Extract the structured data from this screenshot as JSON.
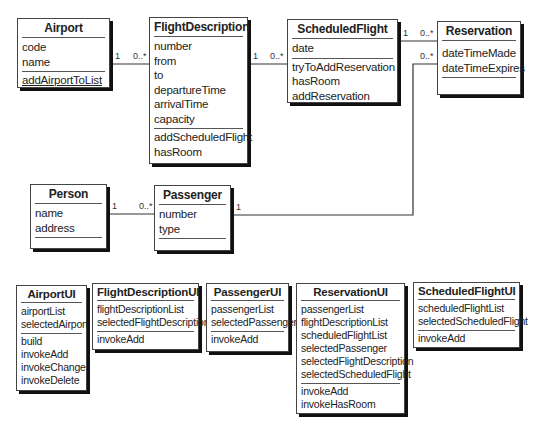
{
  "domain_classes": {
    "airport": {
      "name": "Airport",
      "attributes": [
        "code",
        "name"
      ],
      "operations": [
        "addAirportToList"
      ]
    },
    "flight_description": {
      "name": "FlightDescription",
      "attributes": [
        "number",
        "from",
        "to",
        "departureTime",
        "arrivalTime",
        "capacity"
      ],
      "operations": [
        "addScheduledFlight",
        "hasRoom"
      ]
    },
    "scheduled_flight": {
      "name": "ScheduledFlight",
      "attributes": [
        "date"
      ],
      "operations": [
        "tryToAddReservation",
        "hasRoom",
        "addReservation"
      ]
    },
    "reservation": {
      "name": "Reservation",
      "attributes": [
        "dateTimeMade",
        "dateTimeExpires"
      ],
      "operations": []
    },
    "person": {
      "name": "Person",
      "attributes": [
        "name",
        "address"
      ],
      "operations": []
    },
    "passenger": {
      "name": "Passenger",
      "attributes": [
        "number",
        "type"
      ],
      "operations": []
    }
  },
  "ui_classes": {
    "airport_ui": {
      "name": "AirportUI",
      "attributes": [
        "airportList",
        "selectedAirport"
      ],
      "operations": [
        "build",
        "invokeAdd",
        "invokeChange",
        "invokeDelete"
      ]
    },
    "flight_description_ui": {
      "name": "FlightDescriptionUI",
      "attributes": [
        "flightDescriptionList",
        "selectedFlightDescription"
      ],
      "operations": [
        "invokeAdd"
      ]
    },
    "passenger_ui": {
      "name": "PassengerUI",
      "attributes": [
        "passengerList",
        "selectedPassenger"
      ],
      "operations": [
        "invokeAdd"
      ]
    },
    "reservation_ui": {
      "name": "ReservationUI",
      "attributes": [
        "passengerList",
        "flightDescriptionList",
        "scheduledFlightList",
        "selectedPassenger",
        "selectedFlightDescription",
        "selectedScheduledFlight"
      ],
      "operations": [
        "invokeAdd",
        "invokeHasRoom"
      ]
    },
    "scheduled_flight_ui": {
      "name": "ScheduledFlightUI",
      "attributes": [
        "scheduledFlightList",
        "selectedScheduledFlight"
      ],
      "operations": [
        "invokeAdd"
      ]
    }
  },
  "associations": [
    {
      "from": "Airport",
      "to": "FlightDescription",
      "from_mult": "1",
      "to_mult": "0..*"
    },
    {
      "from": "FlightDescription",
      "to": "ScheduledFlight",
      "from_mult": "1",
      "to_mult": "0..*"
    },
    {
      "from": "ScheduledFlight",
      "to": "Reservation",
      "from_mult": "1",
      "to_mult": "0..*"
    },
    {
      "from": "Person",
      "to": "Passenger",
      "from_mult": "1",
      "to_mult": "0..*"
    },
    {
      "from": "Passenger",
      "to": "Reservation",
      "from_mult": "1",
      "to_mult": "0..*"
    }
  ]
}
